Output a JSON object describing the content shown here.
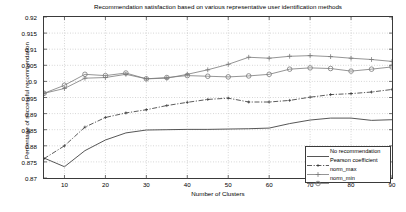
{
  "chart_data": {
    "type": "line",
    "title": "Recommendation satisfaction based on various representative user identification methods",
    "xlabel": "Number of Clusters",
    "ylabel": "Percentage of successful recommendation",
    "xlim": [
      5,
      90
    ],
    "ylim": [
      0.87,
      0.92
    ],
    "xticks": [
      10,
      20,
      30,
      40,
      50,
      60,
      70,
      80,
      90
    ],
    "yticks": [
      0.87,
      0.875,
      0.88,
      0.885,
      0.89,
      0.895,
      0.9,
      0.905,
      0.91,
      0.915,
      0.92
    ],
    "ytick_labels": [
      "0.87",
      "0.875",
      "0.88",
      "0.885",
      "0.89",
      "0.895",
      "0.9",
      "0.905",
      "0.91",
      "0.915",
      "0.92"
    ],
    "xtick_labels": [
      "10",
      "20",
      "30",
      "40",
      "50",
      "60",
      "70",
      "80",
      "90"
    ],
    "grid": true,
    "grid_style": "dotted",
    "legend_position": "lower right",
    "x": [
      5,
      10,
      15,
      20,
      25,
      30,
      35,
      40,
      45,
      50,
      55,
      60,
      65,
      70,
      75,
      80,
      85,
      90
    ],
    "series": [
      {
        "name": "No recommendation",
        "style": "solid",
        "marker": "none",
        "color": "#4d4d4d",
        "values": [
          0.8762,
          0.8735,
          0.8785,
          0.8818,
          0.884,
          0.8849,
          0.885,
          0.8851,
          0.8851,
          0.8852,
          0.8853,
          0.8855,
          0.8869,
          0.888,
          0.8886,
          0.8886,
          0.8879,
          0.8881
        ]
      },
      {
        "name": "Pearson coefficient",
        "style": "dashdot",
        "marker": "plus-small",
        "color": "#333333",
        "values": [
          0.876,
          0.88,
          0.8858,
          0.8888,
          0.8902,
          0.8912,
          0.8925,
          0.8935,
          0.8944,
          0.8948,
          0.8936,
          0.8936,
          0.8941,
          0.8951,
          0.8959,
          0.8962,
          0.8967,
          0.8975
        ]
      },
      {
        "name": "norm_max",
        "style": "solid",
        "marker": "plus",
        "color": "#7a7a7a",
        "values": [
          0.8963,
          0.8978,
          0.901,
          0.9012,
          0.9022,
          0.9008,
          0.901,
          0.9022,
          0.9036,
          0.9053,
          0.9075,
          0.9072,
          0.9078,
          0.908,
          0.9077,
          0.9072,
          0.9068,
          0.9062
        ]
      },
      {
        "name": "norm_min",
        "style": "solid",
        "marker": "circle",
        "color": "#7a7a7a",
        "values": [
          0.8963,
          0.8988,
          0.9022,
          0.9018,
          0.9026,
          0.9008,
          0.9012,
          0.9018,
          0.9016,
          0.9014,
          0.9017,
          0.9022,
          0.9038,
          0.9042,
          0.904,
          0.9032,
          0.9038,
          0.9045
        ]
      }
    ]
  },
  "legend": {
    "items": [
      {
        "label": "No recommendation"
      },
      {
        "label": "Pearson coefficient"
      },
      {
        "label": "norm_max"
      },
      {
        "label": "norm_min"
      }
    ]
  }
}
